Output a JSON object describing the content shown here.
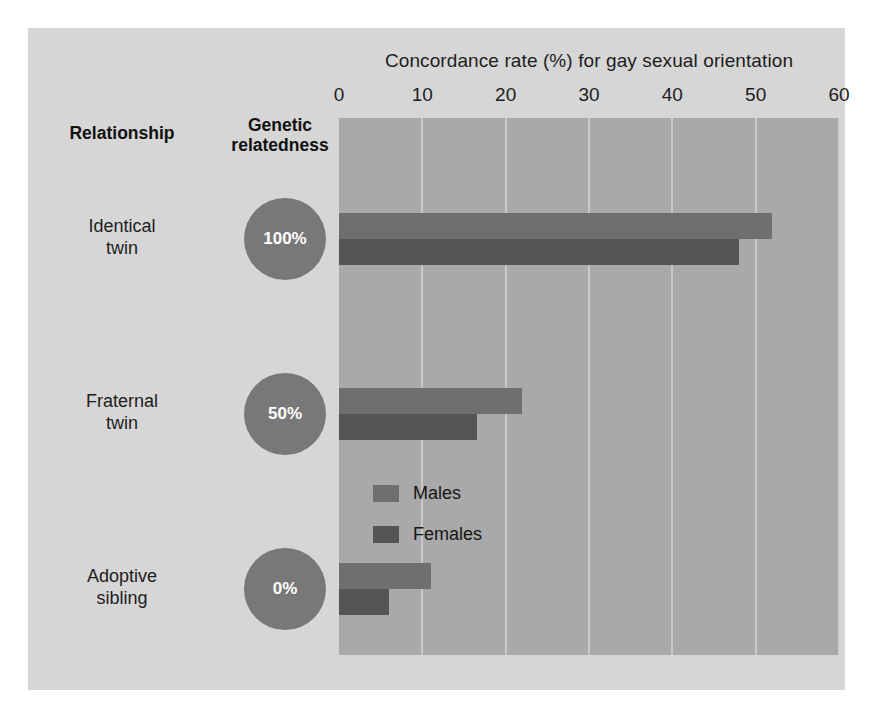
{
  "chart_data": {
    "type": "bar",
    "orientation": "horizontal",
    "title": "Concordance rate (%) for gay sexual orientation",
    "xlabel": "",
    "ylabel": "",
    "xlim": [
      0,
      60
    ],
    "xticks": [
      0,
      10,
      20,
      30,
      40,
      50,
      60
    ],
    "grid": true,
    "legend_position": "inside-bottom-right",
    "categories": [
      "Identical twin",
      "Fraternal twin",
      "Adoptive sibling"
    ],
    "series": [
      {
        "name": "Males",
        "color": "#6f6f6f",
        "values": [
          52,
          22,
          11
        ]
      },
      {
        "name": "Females",
        "color": "#555555",
        "values": [
          48,
          16.5,
          6
        ]
      }
    ]
  },
  "table": {
    "headers": {
      "relationship": "Relationship",
      "genetic_line1": "Genetic",
      "genetic_line2": "relatedness"
    },
    "rows": [
      {
        "label_line1": "Identical",
        "label_line2": "twin",
        "relatedness": "100%"
      },
      {
        "label_line1": "Fraternal",
        "label_line2": "twin",
        "relatedness": "50%"
      },
      {
        "label_line1": "Adoptive",
        "label_line2": "sibling",
        "relatedness": "0%"
      }
    ]
  },
  "legend": {
    "items": [
      {
        "label": "Males"
      },
      {
        "label": "Females"
      }
    ]
  },
  "colors": {
    "page_background": "#ffffff",
    "panel_background": "#d6d6d6",
    "plot_background": "#a9a9a9",
    "gridline": "#c9c9c9",
    "circle_fill": "#787878",
    "males_bar": "#6f6f6f",
    "females_bar": "#555555",
    "text": "#1d1d1d"
  }
}
